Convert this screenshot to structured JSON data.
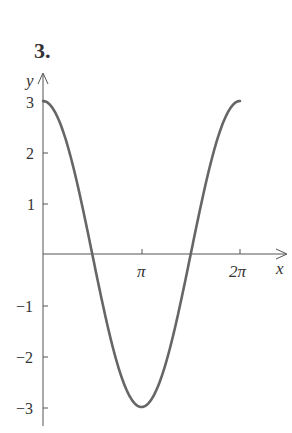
{
  "problem_number": "3.",
  "chart_data": {
    "type": "line",
    "title": "",
    "xlabel": "x",
    "ylabel": "y",
    "function": "y = 3cos(x)",
    "x_ticks": [
      "π",
      "2π"
    ],
    "y_ticks": [
      "3",
      "2",
      "1",
      "-1",
      "-2",
      "-3"
    ],
    "xlim": [
      0,
      6.283
    ],
    "ylim": [
      -3,
      3
    ],
    "grid": false,
    "series": [
      {
        "name": "y = 3cos(x)",
        "x": [
          0,
          0.785,
          1.571,
          2.356,
          3.142,
          3.927,
          4.712,
          5.498,
          6.283
        ],
        "y": [
          3,
          2.12,
          0,
          -2.12,
          -3,
          -2.12,
          0,
          2.12,
          3
        ]
      }
    ],
    "color": "#666666"
  },
  "labels": {
    "x_axis": "x",
    "y_axis": "y",
    "pi": "π",
    "two_pi": "2π",
    "y3": "3",
    "y2": "2",
    "y1": "1",
    "ym1": "−1",
    "ym2": "−2",
    "ym3": "−3"
  }
}
